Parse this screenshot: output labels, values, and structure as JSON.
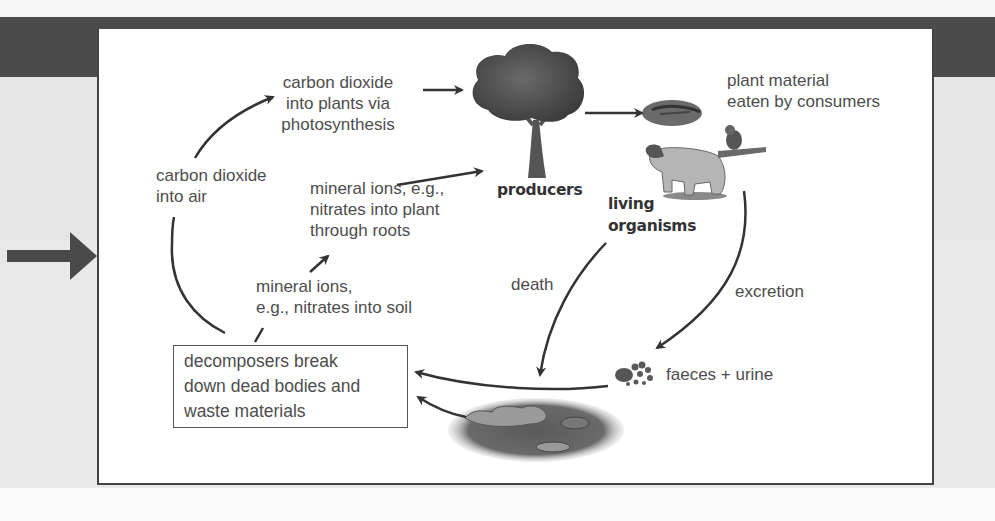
{
  "diagram": {
    "nodes": {
      "co2_plants": "carbon dioxide\ninto plants via\nphotosynthesis",
      "co2_air": "carbon dioxide\ninto air",
      "mineral_plant": "mineral ions, e.g.,\nnitrates into plant\nthrough roots",
      "mineral_soil": "mineral ions,\ne.g., nitrates into soil",
      "producers": "producers",
      "plant_material": "plant material\neaten by consumers",
      "living_organisms": "living\norganisms",
      "death": "death",
      "excretion": "excretion",
      "faeces": "faeces + urine",
      "decomposers": "decomposers break\ndown dead bodies and\nwaste materials"
    },
    "icons": {
      "tree": "tree-icon",
      "leaf": "leaf-icon",
      "sheep": "sheep-icon",
      "bird": "bird-icon",
      "faeces": "faeces-icon",
      "dead_matter": "dead-matter-icon",
      "pointer_arrow": "right-arrow-icon"
    },
    "edges": [
      {
        "from": "co2_air",
        "to": "co2_plants"
      },
      {
        "from": "co2_plants",
        "to": "producers"
      },
      {
        "from": "mineral_plant",
        "to": "producers"
      },
      {
        "from": "producers",
        "to": "plant_material"
      },
      {
        "from": "mineral_soil",
        "to": "mineral_plant"
      },
      {
        "from": "decomposers",
        "to": "mineral_soil"
      },
      {
        "from": "decomposers",
        "to": "co2_air"
      },
      {
        "from": "living_organisms",
        "to": "dead_matter",
        "label": "death"
      },
      {
        "from": "living_organisms",
        "to": "faeces",
        "label": "excretion"
      },
      {
        "from": "faeces",
        "to": "decomposers"
      },
      {
        "from": "dead_matter",
        "to": "decomposers"
      }
    ],
    "colors": {
      "bar": "#4b4b4b",
      "border": "#444444",
      "text": "#4d4d4d",
      "arrow": "#333333"
    }
  }
}
